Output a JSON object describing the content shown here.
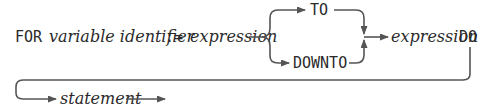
{
  "diagram": {
    "type": "syntax-diagram",
    "tokens": {
      "for_kw": "FOR",
      "variable": "variable identifier",
      "assign": ":=",
      "expr1": "expression",
      "to_kw": "TO",
      "downto_kw": "DOWNTO",
      "expr2": "expression",
      "do_kw": "DO",
      "statement": "statement"
    },
    "colors": {
      "line": "#555555",
      "text": "#2a2a2a"
    }
  }
}
